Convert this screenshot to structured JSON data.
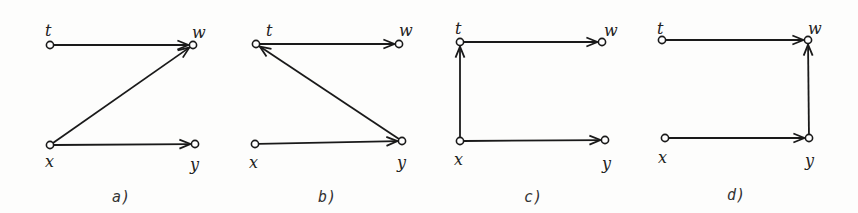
{
  "colors": {
    "stroke": "#1a1a1a",
    "background": "#fdfdfc"
  },
  "diagrams": [
    {
      "caption": "a)",
      "caption_pos": [
        112,
        202
      ],
      "nodes": {
        "t": {
          "label": "t",
          "x": 50,
          "y": 45,
          "lx": 45,
          "ly": 36
        },
        "w": {
          "label": "w",
          "x": 193,
          "y": 45,
          "lx": 192,
          "ly": 38
        },
        "x": {
          "label": "x",
          "x": 50,
          "y": 145,
          "lx": 45,
          "ly": 167
        },
        "y": {
          "label": "y",
          "x": 195,
          "y": 144,
          "lx": 190,
          "ly": 170
        }
      },
      "edges": [
        [
          "t",
          "w"
        ],
        [
          "x",
          "w"
        ],
        [
          "x",
          "y"
        ]
      ]
    },
    {
      "caption": "b)",
      "caption_pos": [
        318,
        202
      ],
      "nodes": {
        "t": {
          "label": "t",
          "x": 256,
          "y": 44,
          "lx": 266,
          "ly": 36
        },
        "w": {
          "label": "w",
          "x": 399,
          "y": 44,
          "lx": 399,
          "ly": 36
        },
        "x": {
          "label": "x",
          "x": 255,
          "y": 144,
          "lx": 249,
          "ly": 168
        },
        "y": {
          "label": "y",
          "x": 402,
          "y": 141,
          "lx": 397,
          "ly": 168
        }
      },
      "edges": [
        [
          "t",
          "w"
        ],
        [
          "y",
          "t"
        ],
        [
          "x",
          "y"
        ]
      ]
    },
    {
      "caption": "c)",
      "caption_pos": [
        524,
        202
      ],
      "nodes": {
        "t": {
          "label": "t",
          "x": 460,
          "y": 42,
          "lx": 455,
          "ly": 34
        },
        "w": {
          "label": "w",
          "x": 602,
          "y": 42,
          "lx": 604,
          "ly": 36
        },
        "x": {
          "label": "x",
          "x": 460,
          "y": 141,
          "lx": 454,
          "ly": 165
        },
        "y": {
          "label": "y",
          "x": 605,
          "y": 140,
          "lx": 602,
          "ly": 169
        }
      },
      "edges": [
        [
          "t",
          "w"
        ],
        [
          "x",
          "t"
        ],
        [
          "x",
          "y"
        ]
      ]
    },
    {
      "caption": "d)",
      "caption_pos": [
        727,
        200
      ],
      "nodes": {
        "t": {
          "label": "t",
          "x": 662,
          "y": 40,
          "lx": 657,
          "ly": 34
        },
        "w": {
          "label": "w",
          "x": 808,
          "y": 40,
          "lx": 808,
          "ly": 34
        },
        "x": {
          "label": "x",
          "x": 665,
          "y": 138,
          "lx": 658,
          "ly": 163
        },
        "y": {
          "label": "y",
          "x": 809,
          "y": 138,
          "lx": 805,
          "ly": 166
        }
      },
      "edges": [
        [
          "t",
          "w"
        ],
        [
          "y",
          "w"
        ],
        [
          "x",
          "y"
        ]
      ]
    }
  ]
}
